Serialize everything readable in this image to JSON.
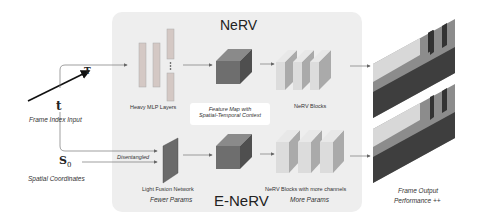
{
  "diagram": {
    "top_model_title": "NeRV",
    "bottom_model_title": "E-NeRV",
    "inputs": {
      "time_symbol_t": "t",
      "time_symbol_T": "T",
      "time_label": "Frame Index Input",
      "spatial_symbol": "S",
      "spatial_subscript": "0",
      "spatial_label": "Spatial Coordinates",
      "disentangled_label": "Disentangled"
    },
    "nerv": {
      "mlp_label": "Heavy MLP Layers",
      "mlp_ellipsis": "⋮",
      "feature_label_line1": "Feature Map with",
      "feature_label_line2": "Spatial-Temporal Context",
      "blocks_label": "NeRV Blocks"
    },
    "enerv": {
      "fusion_label": "Light Fusion Network",
      "fusion_sub": "Fewer Params",
      "blocks_label": "NeRV Blocks with more channels",
      "blocks_sub": "More Params"
    },
    "output": {
      "label_line1": "Frame Output",
      "label_line2": "Performance ++"
    },
    "colors": {
      "panel": "#eeeeee",
      "cube_front": "#6e6e6e",
      "cube_top": "#8a8a8a",
      "cube_side": "#555555",
      "block_face": "#dcdcdc",
      "block_side": "#b0b0b0",
      "mlp_bar": "#c8c8c8",
      "arrow": "#666666"
    }
  }
}
